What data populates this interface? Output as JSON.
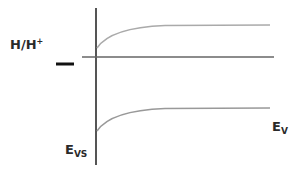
{
  "diagram": {
    "title": "",
    "labels": {
      "redox_main": "H/H",
      "redox_sup": "+",
      "evs_main": "E",
      "evs_sub": "VS",
      "ev_main": "E",
      "ev_sub": "V"
    },
    "elements": {
      "vertical_axis": {
        "x": 96,
        "y1": 8,
        "y2": 165,
        "color": "#555555"
      },
      "horizontal_level": {
        "y": 57,
        "x1": 82,
        "x2": 274,
        "color": "#666666"
      },
      "redox_marker": {
        "x1": 56,
        "x2": 74,
        "y": 64,
        "color": "#111111"
      },
      "upper_band_curve": {
        "start": [
          97,
          48
        ],
        "end": [
          270,
          25
        ],
        "color": "#aaaaaa"
      },
      "lower_band_curve": {
        "start": [
          97,
          131
        ],
        "end": [
          270,
          108
        ],
        "color": "#999999"
      }
    }
  }
}
